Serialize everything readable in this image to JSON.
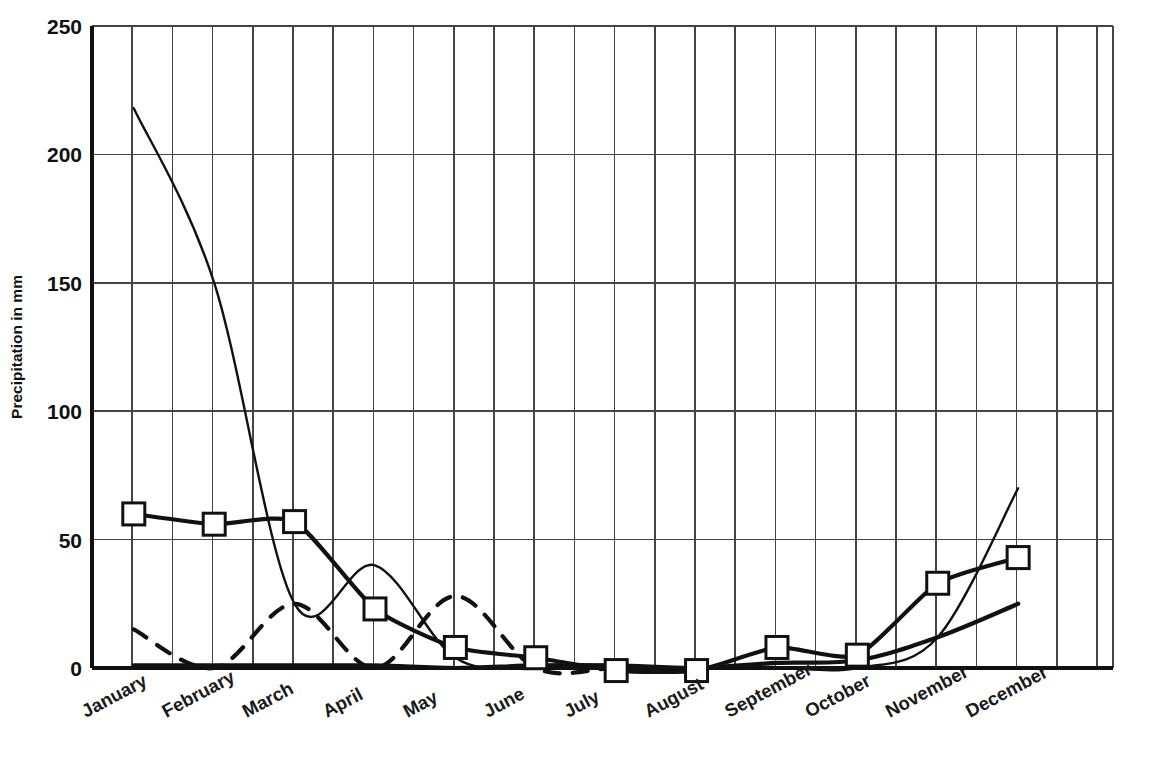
{
  "chart_data": {
    "type": "line",
    "title": "",
    "xlabel": "",
    "ylabel": "Precipitation in mm",
    "ylim": [
      0,
      250
    ],
    "yticks": [
      0,
      50,
      100,
      150,
      200,
      250
    ],
    "ytick_labels": [
      "0",
      "50",
      "100",
      "150",
      "200",
      "250"
    ],
    "grid": true,
    "legend_position": "none",
    "categories": [
      "January",
      "February",
      "March",
      "April",
      "May",
      "June",
      "July",
      "August",
      "September",
      "October",
      "November",
      "December"
    ],
    "series": [
      {
        "name": "series-with-square-markers",
        "style": "solid-thick-markers",
        "marker": "open-square",
        "values": [
          60,
          56,
          57,
          23,
          8,
          4,
          -1,
          -1,
          8,
          5,
          33,
          43
        ]
      },
      {
        "name": "series-thin-solid",
        "style": "solid-thin",
        "marker": "none",
        "values": [
          218,
          150,
          25,
          40,
          4,
          0,
          0,
          0,
          0,
          0,
          12,
          70
        ]
      },
      {
        "name": "series-thick-solid-no-markers",
        "style": "solid-thick",
        "marker": "none",
        "values": [
          1,
          1,
          1,
          1,
          0,
          1,
          1,
          0,
          2,
          3,
          12,
          25
        ]
      },
      {
        "name": "series-dashed",
        "style": "dashed",
        "marker": "none",
        "values": [
          15,
          0,
          25,
          0,
          28,
          0,
          0,
          0,
          0,
          0,
          0,
          0
        ]
      }
    ]
  },
  "axes": {
    "y_axis_title": "Precipitation in mm",
    "y_tick_0": "0",
    "y_tick_50": "50",
    "y_tick_100": "100",
    "y_tick_150": "150",
    "y_tick_200": "200",
    "y_tick_250": "250"
  },
  "months": {
    "jan": "January",
    "feb": "February",
    "mar": "March",
    "apr": "April",
    "may": "May",
    "jun": "June",
    "jul": "July",
    "aug": "August",
    "sep": "September",
    "oct": "October",
    "nov": "November",
    "dec": "December"
  },
  "colors": {
    "line": "#111111",
    "grid": "#444444",
    "background": "#ffffff",
    "marker_fill": "#ffffff"
  }
}
